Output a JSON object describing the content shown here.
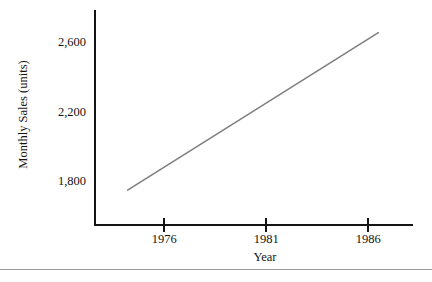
{
  "chart_data": {
    "type": "line",
    "title": "",
    "xlabel": "Year",
    "ylabel": "Monthly Sales (units)",
    "xlim": [
      1972.6,
      1988.2
    ],
    "ylim": [
      1555,
      2790
    ],
    "grid": false,
    "legend": "none",
    "line_color": "#808080",
    "axis_color": "#141414",
    "x_ticks": [
      {
        "value": 1976,
        "label": "1976"
      },
      {
        "value": 1981,
        "label": "1981"
      },
      {
        "value": 1986,
        "label": "1986"
      }
    ],
    "y_ticks": [
      {
        "value": 2600,
        "label": "2,600"
      },
      {
        "value": 2200,
        "label": "2,200"
      },
      {
        "value": 1800,
        "label": "1,800"
      }
    ],
    "series": [
      {
        "name": "Monthly Sales",
        "x": [
          1974.2,
          1986.5
        ],
        "values": [
          1755,
          2660
        ]
      }
    ]
  },
  "footer": {
    "rule": ""
  }
}
